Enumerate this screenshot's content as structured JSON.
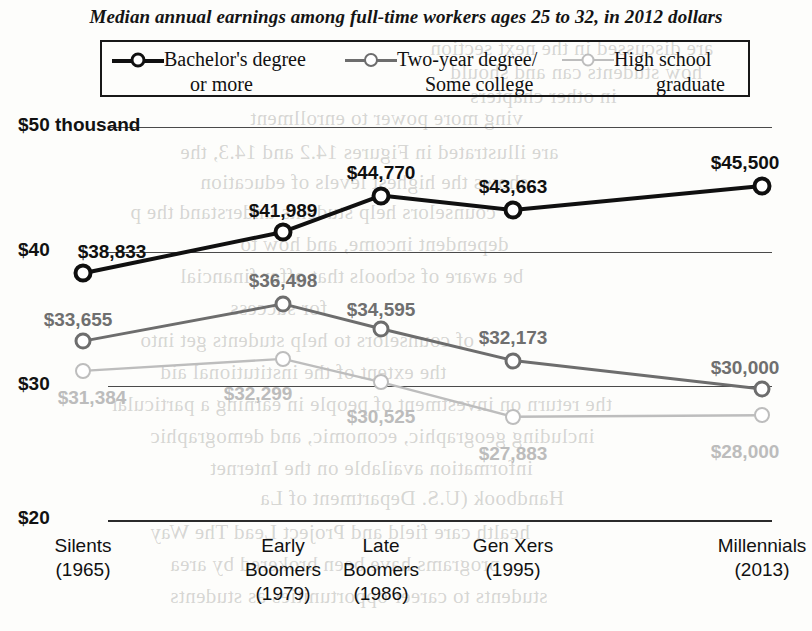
{
  "chart_data": {
    "type": "line",
    "title": "Median annual earnings among full-time workers ages 25 to 32, in 2012 dollars",
    "xlabel": "",
    "ylabel": "",
    "ylim": [
      20000,
      50000
    ],
    "grid": true,
    "legend_position": "top",
    "categories": [
      "Silents",
      "Early Boomers",
      "Late Boomers",
      "Gen Xers",
      "Millennials"
    ],
    "category_years": [
      "(1965)",
      "(1979)",
      "(1986)",
      "(1995)",
      "(2013)"
    ],
    "ytick_labels": [
      "$50 thousand",
      "$40",
      "$30",
      "$20"
    ],
    "ytick_values": [
      50000,
      40000,
      30000,
      20000
    ],
    "series": [
      {
        "name": "Bachelor's degree or more",
        "color": "#101010",
        "values": [
          38833,
          41989,
          44770,
          43663,
          45500
        ],
        "labels": [
          "$38,833",
          "$41,989",
          "$44,770",
          "$43,663",
          "$45,500"
        ]
      },
      {
        "name": "Two-year degree/Some college",
        "color": "#6d6d6d",
        "values": [
          33655,
          36498,
          34595,
          32173,
          30000
        ],
        "labels": [
          "$33,655",
          "$36,498",
          "$34,595",
          "$32,173",
          "$30,000"
        ]
      },
      {
        "name": "High school graduate",
        "color": "#bdbdbd",
        "values": [
          31384,
          32299,
          30525,
          27883,
          28000
        ],
        "labels": [
          "$31,384",
          "$32,299",
          "$30,525",
          "$27,883",
          "$28,000"
        ]
      }
    ]
  },
  "legend": {
    "items": [
      {
        "line1": "Bachelor's degree",
        "line2": "or more"
      },
      {
        "line1": "Two-year degree/",
        "line2": "Some college"
      },
      {
        "line1": "High school",
        "line2": "graduate"
      }
    ]
  },
  "bleed_text": {
    "lines": [
      "are discussed in the next section",
      "how students can and should",
      "in other chapters",
      "ving more power to enrollment",
      "are illustrated in Figures 14.2 and 14.3, the",
      "shows the highest levels of education",
      "counselors help students understand the p",
      "dependent income, and how to",
      "be aware of schools that offer financial",
      "for success",
      "of counselors to help students get into",
      "the extent of the institutional aid",
      "the return on investment of people in earning a particular",
      "including geographic, economic, and demographic",
      "information available on the Internet",
      "Handbook (U.S. Department of La",
      "health care field and Project Lead The Way",
      "programs have been brokered by area",
      "students to career opportunities as students"
    ]
  }
}
